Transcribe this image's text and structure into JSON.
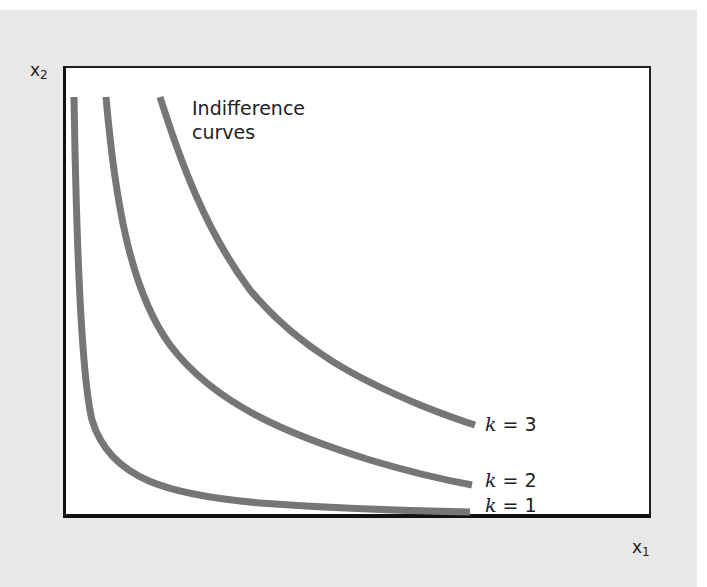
{
  "diagram": {
    "axes": {
      "y_label": "x",
      "y_label_sub": "2",
      "x_label": "x",
      "x_label_sub": "1"
    },
    "annotation": {
      "line1": "Indifference",
      "line2": "curves"
    },
    "curves": [
      {
        "id": "k1",
        "var": "k",
        "eq": "= 1",
        "color": "#767676"
      },
      {
        "id": "k2",
        "var": "k",
        "eq": "= 2",
        "color": "#767676"
      },
      {
        "id": "k3",
        "var": "k",
        "eq": "= 3",
        "color": "#767676"
      }
    ],
    "colors": {
      "background": "#e8e8e8",
      "plot_area": "#ffffff",
      "axis": "#111111",
      "curve": "#767676"
    }
  }
}
